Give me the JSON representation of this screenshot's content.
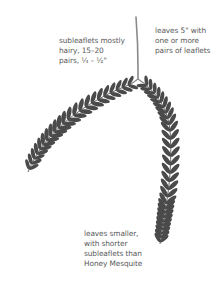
{
  "figure": {
    "colors": {
      "background": "#ffffff",
      "leaflet": "#4a4a4a",
      "stem": "#8a8a8a",
      "text": "#5a5a5a"
    }
  },
  "annotations": {
    "subleaflets": {
      "lines": [
        "subleaflets mostly",
        "hairy, 15–20",
        "pairs, ¼ – ½\""
      ]
    },
    "leaves": {
      "lines": [
        "leaves 5\" with",
        "one or more",
        "pairs of leaflets"
      ]
    },
    "comparison": {
      "lines": [
        "leaves smaller,",
        "with shorter",
        "subleaflets than",
        "Honey Mesquite"
      ]
    }
  }
}
